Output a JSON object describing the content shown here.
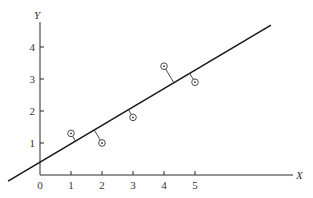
{
  "chart_data": {
    "type": "scatter",
    "title": "",
    "xlabel": "X",
    "ylabel": "Y",
    "xlim": [
      0,
      8
    ],
    "ylim": [
      0,
      4.7
    ],
    "grid": false,
    "legend": null,
    "x_ticks": [
      0,
      1,
      2,
      3,
      4,
      5
    ],
    "x_tick_labels": [
      "0",
      "1",
      "2",
      "3",
      "4",
      "5"
    ],
    "y_ticks": [
      1,
      2,
      3,
      4
    ],
    "y_tick_labels": [
      "1",
      "2",
      "3",
      "4"
    ],
    "series": [
      {
        "name": "observations",
        "marker": "circle-with-dot",
        "points": [
          {
            "x": 1,
            "y": 1.3
          },
          {
            "x": 2,
            "y": 1.0
          },
          {
            "x": 3,
            "y": 1.8
          },
          {
            "x": 4,
            "y": 3.4
          },
          {
            "x": 5,
            "y": 2.9
          }
        ]
      }
    ],
    "fit_line": {
      "name": "regression line",
      "intercept": 0.4,
      "slope": 0.575,
      "x_start": -1.03,
      "x_end": 7.45
    },
    "annotations": [
      "residual segments drawn from each point perpendicular to the fitted line"
    ]
  },
  "layout": {
    "origin_px": [
      40,
      175
    ],
    "x_unit_px": 31,
    "y_unit_px": 32,
    "x_axis_end_px": 293,
    "y_axis_top_px": 22,
    "colors": {
      "ink": "#2a2a2a",
      "background": "#ffffff"
    }
  }
}
